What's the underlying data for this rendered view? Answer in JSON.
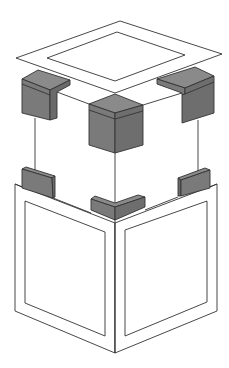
{
  "diagram": {
    "colors": {
      "background": "#ffffff",
      "outline": "#333333",
      "block_top": "#8a8a8a",
      "block_left": "#7a7a7a",
      "block_right": "#6e6e6e",
      "panel": "#ffffff"
    },
    "parts": [
      {
        "name": "top-frame",
        "label": "Top frame (square ring)"
      },
      {
        "name": "corner-block-back-left",
        "label": "Upper corner protector (left)"
      },
      {
        "name": "corner-block-front",
        "label": "Upper corner protector (front)"
      },
      {
        "name": "corner-block-back-right",
        "label": "Upper corner protector (right)"
      },
      {
        "name": "lower-block-left",
        "label": "Lower corner protector (left)"
      },
      {
        "name": "lower-block-front",
        "label": "Lower corner protector (front, L-shaped)"
      },
      {
        "name": "lower-block-right",
        "label": "Lower corner protector (right)"
      },
      {
        "name": "side-panel-left",
        "label": "Left side panel"
      },
      {
        "name": "side-panel-right",
        "label": "Right side panel"
      }
    ]
  }
}
